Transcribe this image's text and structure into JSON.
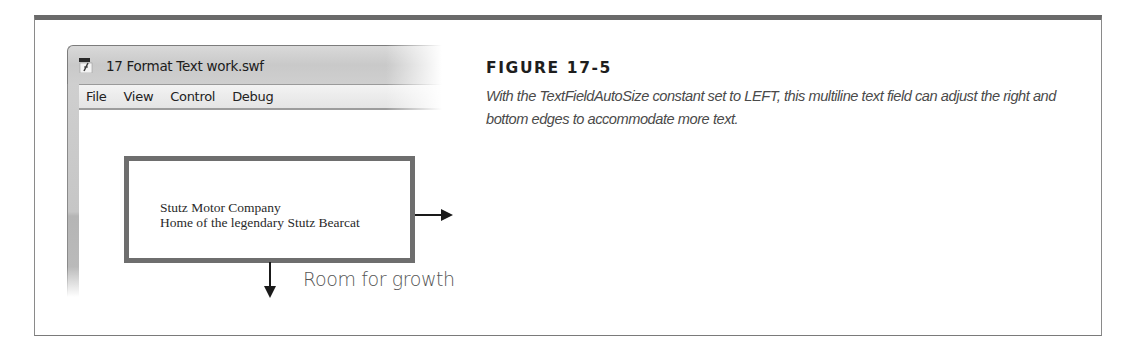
{
  "figure": {
    "number": "FIGURE 17-5",
    "caption": "With the TextFieldAutoSize constant set to LEFT, this multiline text field can adjust the right and bottom edges to accommodate more text."
  },
  "window": {
    "title": "17 Format Text work.swf",
    "icon": "flash-player-icon",
    "menu": [
      {
        "label": "File"
      },
      {
        "label": "View"
      },
      {
        "label": "Control"
      },
      {
        "label": "Debug"
      }
    ]
  },
  "text_field": {
    "lines": [
      "Stutz Motor Company",
      "Home of the legendary Stutz Bearcat"
    ]
  },
  "annotations": {
    "right_arrow": "arrow-right-icon",
    "down_arrow": "arrow-down-icon",
    "growth_label": "Room for growth"
  },
  "colors": {
    "frame_border": "#6a6a6a",
    "text_field_border": "#6e6e6e",
    "caption_text": "#4a4a4a"
  }
}
